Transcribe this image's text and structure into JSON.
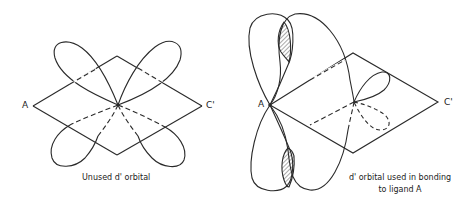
{
  "left_figure": {
    "vertex_left_label": "A",
    "vertex_right_label": "C'",
    "caption": "Unused d' orbital"
  },
  "right_figure": {
    "vertex_left_label": "A",
    "vertex_right_label": "C'",
    "caption_line1": "d' orbital used in bonding",
    "caption_line2": "to ligand A"
  },
  "colors": {
    "stroke": "#2a2a2a",
    "background": "#ffffff"
  }
}
